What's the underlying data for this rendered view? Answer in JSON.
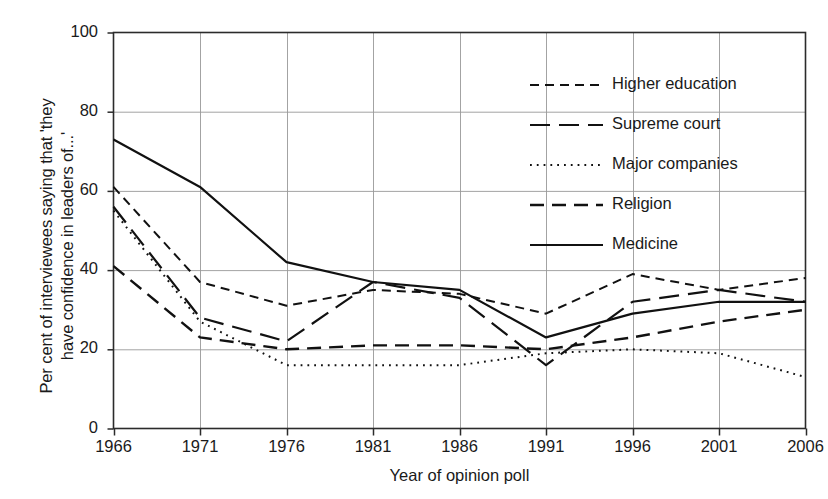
{
  "chart_data": {
    "type": "line",
    "title": "",
    "xlabel": "Year of opinion poll",
    "ylabel": "Per cent of interviewees saying that 'they\nhave confidence in leaders of...'",
    "x": [
      1966,
      1971,
      1976,
      1981,
      1986,
      1991,
      1996,
      2001,
      2006
    ],
    "xtick_labels": [
      "1966",
      "1971",
      "1976",
      "1981",
      "1986",
      "1991",
      "1996",
      "2001",
      "2006"
    ],
    "ytick_labels": [
      "0",
      "20",
      "40",
      "60",
      "80",
      "100"
    ],
    "ytick_values": [
      0,
      20,
      40,
      60,
      80,
      100
    ],
    "xlim": [
      1966,
      2006
    ],
    "ylim": [
      0,
      100
    ],
    "grid": true,
    "grid_color": "#999999",
    "legend_position": "upper right",
    "line_color": "#111111",
    "series": [
      {
        "name": "Higher education",
        "dash": "short-dash",
        "dasharray": "9,6",
        "width": 2.0,
        "values": [
          61,
          37,
          31,
          35,
          34,
          29,
          39,
          35,
          38
        ]
      },
      {
        "name": "Supreme court",
        "dash": "long-dash",
        "dasharray": "20,9",
        "width": 2.2,
        "values": [
          56,
          28,
          22,
          37,
          33,
          16,
          32,
          35,
          32
        ]
      },
      {
        "name": "Major companies",
        "dash": "dotted",
        "dasharray": "1.8,5",
        "width": 2.0,
        "values": [
          55,
          27,
          16,
          16,
          16,
          19,
          20,
          19,
          13
        ]
      },
      {
        "name": "Religion",
        "dash": "medium-dash",
        "dasharray": "14,8",
        "width": 2.4,
        "values": [
          41,
          23,
          20,
          21,
          21,
          20,
          23,
          27,
          30
        ]
      },
      {
        "name": "Medicine",
        "dash": "solid",
        "dasharray": "none",
        "width": 2.2,
        "values": [
          73,
          61,
          42,
          37,
          35,
          23,
          29,
          32,
          32
        ]
      }
    ]
  },
  "axes": {
    "y_ticks": [
      {
        "label": "100",
        "value": 100
      },
      {
        "label": "80",
        "value": 80
      },
      {
        "label": "60",
        "value": 60
      },
      {
        "label": "40",
        "value": 40
      },
      {
        "label": "20",
        "value": 20
      },
      {
        "label": "0",
        "value": 0
      }
    ],
    "x_ticks": [
      {
        "label": "1966"
      },
      {
        "label": "1971"
      },
      {
        "label": "1976"
      },
      {
        "label": "1981"
      },
      {
        "label": "1986"
      },
      {
        "label": "1991"
      },
      {
        "label": "1996"
      },
      {
        "label": "2001"
      },
      {
        "label": "2006"
      }
    ]
  },
  "legend": {
    "items": [
      {
        "label": "Higher education"
      },
      {
        "label": "Supreme court"
      },
      {
        "label": "Major companies"
      },
      {
        "label": "Religion"
      },
      {
        "label": "Medicine"
      }
    ]
  }
}
